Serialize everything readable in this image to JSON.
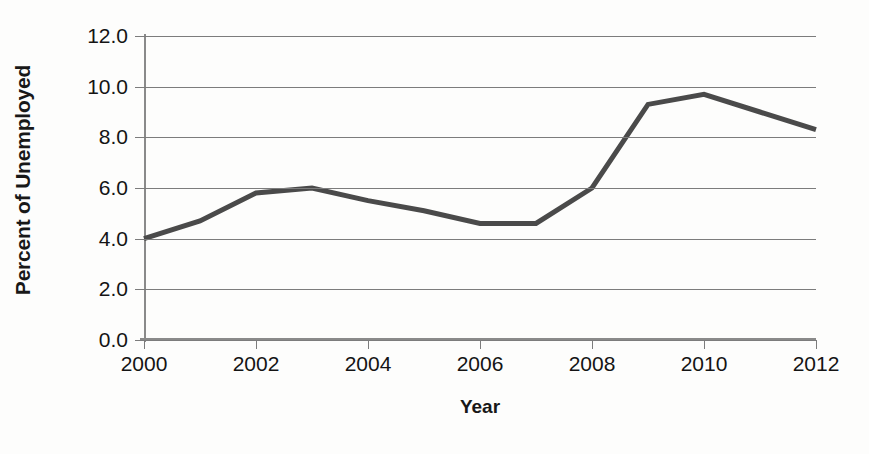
{
  "chart_data": {
    "type": "line",
    "title": "",
    "xlabel": "Year",
    "ylabel": "Percent of Unemployed",
    "x": [
      2000,
      2001,
      2002,
      2003,
      2004,
      2005,
      2006,
      2007,
      2008,
      2009,
      2010,
      2011,
      2012
    ],
    "values": [
      4.0,
      4.7,
      5.8,
      6.0,
      5.5,
      5.1,
      4.6,
      4.6,
      6.0,
      9.3,
      9.7,
      9.0,
      8.3
    ],
    "series": [
      {
        "name": "Percent of Unemployed",
        "values": [
          4.0,
          4.7,
          5.8,
          6.0,
          5.5,
          5.1,
          4.6,
          4.6,
          6.0,
          9.3,
          9.7,
          9.0,
          8.3
        ]
      }
    ],
    "xlim": [
      2000,
      2012
    ],
    "ylim": [
      0.0,
      12.0
    ],
    "yticks": [
      0.0,
      2.0,
      4.0,
      6.0,
      8.0,
      10.0,
      12.0
    ],
    "ytick_labels": [
      "0.0",
      "2.0",
      "4.0",
      "6.0",
      "8.0",
      "10.0",
      "12.0"
    ],
    "xticks": [
      2000,
      2002,
      2004,
      2006,
      2008,
      2010,
      2012
    ],
    "xtick_labels": [
      "2000",
      "2002",
      "2004",
      "2006",
      "2008",
      "2010",
      "2012"
    ],
    "grid": true,
    "grid_axis": "y",
    "legend": false,
    "legend_position": "none",
    "line_color": "#4a4a4a",
    "line_width": 5,
    "grid_color": "#7c7c7c",
    "axis_color": "#8a8a8a",
    "background_color": "#fdfdfc",
    "text_color": "#141414"
  },
  "axis": {
    "y_title": "Percent of Unemployed",
    "x_title": "Year"
  }
}
